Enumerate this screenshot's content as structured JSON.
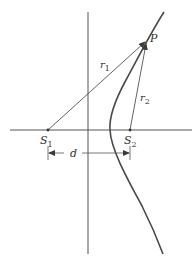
{
  "diagram": {
    "type": "hyperbola-two-sources",
    "colors": {
      "line": "#3a3a3a",
      "curve": "#4a4a4a",
      "background": "#ffffff"
    },
    "labels": {
      "point": "P",
      "r1": "r",
      "r1_sub": "1",
      "r2": "r",
      "r2_sub": "2",
      "s1": "S",
      "s1_sub": "1",
      "s2": "S",
      "s2_sub": "2",
      "distance": "d"
    }
  }
}
